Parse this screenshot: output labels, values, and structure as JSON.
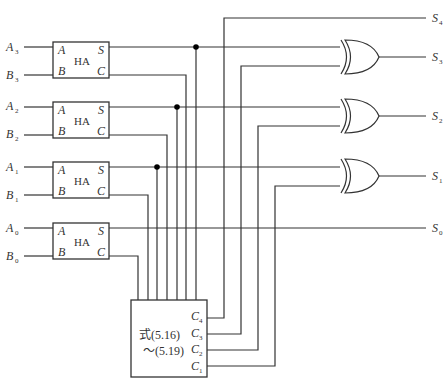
{
  "diagram": {
    "type": "carry-lookahead adder circuit",
    "half_adders": [
      {
        "id": "HA3",
        "label": "HA",
        "in_a": "A",
        "in_b": "B",
        "out_s": "S",
        "out_c": "C",
        "input_a": "A",
        "input_a_sub": "3",
        "input_b": "B",
        "input_b_sub": "3"
      },
      {
        "id": "HA2",
        "label": "HA",
        "in_a": "A",
        "in_b": "B",
        "out_s": "S",
        "out_c": "C",
        "input_a": "A",
        "input_a_sub": "2",
        "input_b": "B",
        "input_b_sub": "2"
      },
      {
        "id": "HA1",
        "label": "HA",
        "in_a": "A",
        "in_b": "B",
        "out_s": "S",
        "out_c": "C",
        "input_a": "A",
        "input_a_sub": "1",
        "input_b": "B",
        "input_b_sub": "1"
      },
      {
        "id": "HA0",
        "label": "HA",
        "in_a": "A",
        "in_b": "B",
        "out_s": "S",
        "out_c": "C",
        "input_a": "A",
        "input_a_sub": "0",
        "input_b": "B",
        "input_b_sub": "0"
      }
    ],
    "carry_block": {
      "line1": "式(5.16)",
      "line2": "～(5.19)",
      "outputs": [
        {
          "name": "C",
          "sub": "4"
        },
        {
          "name": "C",
          "sub": "3"
        },
        {
          "name": "C",
          "sub": "2"
        },
        {
          "name": "C",
          "sub": "1"
        }
      ]
    },
    "xor_gates": [
      "XOR3",
      "XOR2",
      "XOR1"
    ],
    "outputs": [
      {
        "name": "S",
        "sub": "4"
      },
      {
        "name": "S",
        "sub": "3"
      },
      {
        "name": "S",
        "sub": "2"
      },
      {
        "name": "S",
        "sub": "1"
      },
      {
        "name": "S",
        "sub": "0"
      }
    ]
  }
}
